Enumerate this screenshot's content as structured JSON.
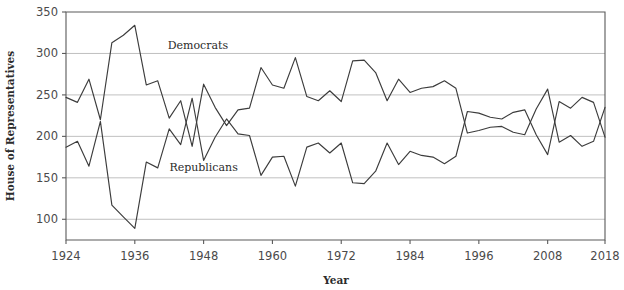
{
  "chart_data": {
    "type": "line",
    "title": "",
    "xlabel": "Year",
    "ylabel": "House of Representatives",
    "xlim": [
      1924,
      2018
    ],
    "ylim": [
      75,
      350
    ],
    "grid": true,
    "legend_position": "inline-annotations",
    "x_ticks": [
      1924,
      1936,
      1948,
      1960,
      1972,
      1984,
      1996,
      2008,
      2018
    ],
    "y_ticks": [
      100,
      150,
      200,
      250,
      300,
      350
    ],
    "x": [
      1924,
      1926,
      1928,
      1930,
      1932,
      1934,
      1936,
      1938,
      1940,
      1942,
      1944,
      1946,
      1948,
      1950,
      1952,
      1954,
      1956,
      1958,
      1960,
      1962,
      1964,
      1966,
      1968,
      1970,
      1972,
      1974,
      1976,
      1978,
      1980,
      1982,
      1984,
      1986,
      1988,
      1990,
      1992,
      1994,
      1996,
      1998,
      2000,
      2002,
      2004,
      2006,
      2008,
      2010,
      2012,
      2014,
      2016,
      2018
    ],
    "series": [
      {
        "name": "Democrats",
        "color": "#3c3c3c",
        "values": [
          247,
          241,
          269,
          220,
          313,
          322,
          334,
          262,
          267,
          222,
          243,
          188,
          263,
          235,
          213,
          232,
          234,
          283,
          262,
          258,
          295,
          248,
          243,
          255,
          242,
          291,
          292,
          277,
          243,
          269,
          253,
          258,
          260,
          267,
          258,
          204,
          207,
          211,
          212,
          205,
          202,
          233,
          257,
          193,
          201,
          188,
          194,
          235
        ],
        "label_annotation": "Democrats"
      },
      {
        "name": "Republicans",
        "color": "#3c3c3c",
        "values": [
          187,
          194,
          164,
          218,
          117,
          103,
          89,
          169,
          162,
          209,
          190,
          246,
          171,
          199,
          221,
          203,
          201,
          153,
          175,
          176,
          140,
          187,
          192,
          180,
          192,
          144,
          143,
          158,
          192,
          166,
          182,
          177,
          175,
          167,
          176,
          230,
          228,
          223,
          221,
          229,
          232,
          202,
          178,
          242,
          234,
          247,
          241,
          199
        ],
        "label_annotation": "Republicans"
      }
    ],
    "annotations": [
      {
        "text": "Democrats",
        "x_year": 1947,
        "y_value": 305
      },
      {
        "text": "Republicans",
        "x_year": 1948,
        "y_value": 158
      }
    ]
  }
}
